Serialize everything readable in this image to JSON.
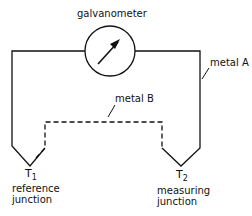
{
  "diagram": {
    "title_label": "galvanometer",
    "wire_a_label": "metal A",
    "wire_b_label": "metal B",
    "junction_1": {
      "symbol": "T",
      "subscript": "1",
      "line1": "reference",
      "line2": "junction"
    },
    "junction_2": {
      "symbol": "T",
      "subscript": "2",
      "line1": "measuring",
      "line2": "junction"
    },
    "colors": {
      "line": "#111111",
      "background": "#ffffff"
    }
  }
}
